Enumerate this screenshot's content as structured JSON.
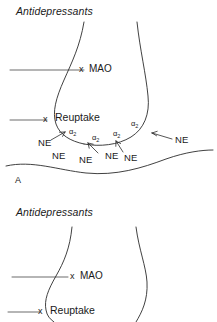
{
  "figure": {
    "background_color": "#ffffff",
    "stroke_color": "#2b2b2b",
    "text_color": "#1a1a1a"
  },
  "panels": [
    {
      "id": "A",
      "panel_label": "A",
      "title": "Antidepressants",
      "labels": {
        "mao": "MAO",
        "mao_block_mark": "x",
        "reuptake": "Reuptake",
        "reuptake_block_mark": "x"
      },
      "receptors": [
        {
          "label": "α2",
          "symbol": "α",
          "subscript": "2"
        },
        {
          "label": "α2",
          "symbol": "α",
          "subscript": "2"
        },
        {
          "label": "α2",
          "symbol": "α",
          "subscript": "2"
        },
        {
          "label": "α2",
          "symbol": "α",
          "subscript": "2"
        }
      ],
      "neurotransmitters": [
        {
          "label": "NE"
        },
        {
          "label": "NE"
        },
        {
          "label": "NE"
        },
        {
          "label": "NE"
        },
        {
          "label": "NE"
        },
        {
          "label": "NE"
        },
        {
          "label": "NE"
        }
      ]
    },
    {
      "id": "B",
      "panel_label": "",
      "title": "Antidepressants",
      "labels": {
        "mao": "MAO",
        "mao_block_mark": "x",
        "reuptake": "Reuptake",
        "reuptake_block_mark": "x"
      },
      "receptors": [],
      "neurotransmitters": []
    }
  ]
}
